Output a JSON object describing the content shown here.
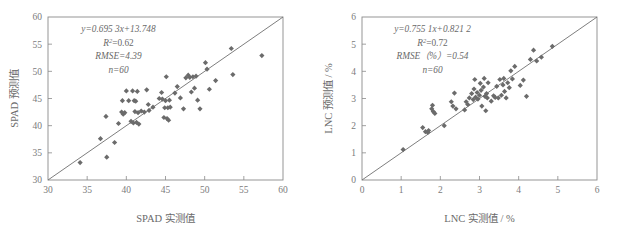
{
  "figure": {
    "panel_count": 2,
    "background": "#ffffff",
    "marker_color": "#6b6b6b",
    "line_color": "#6f6f6f",
    "axis_color": "#8a8a8a",
    "text_color": "#6a6a6a"
  },
  "chart_data": [
    {
      "type": "scatter",
      "panel": "left",
      "title": "",
      "xlabel": "SPAD 实测值",
      "ylabel": "SPAD 预测值",
      "xlim": [
        30,
        60
      ],
      "ylim": [
        30,
        60
      ],
      "xticks": [
        30,
        35,
        40,
        45,
        50,
        55,
        60
      ],
      "yticks": [
        30,
        35,
        40,
        45,
        50,
        55,
        60
      ],
      "grid": false,
      "legend": "none",
      "annotations": {
        "equation": "y=0.695 3x+13.748",
        "r2_label": "R",
        "r2_sup": "2",
        "r2_value": "=0.62",
        "rmse": "RMSE=4.39",
        "n": "n=60"
      },
      "reference_line": {
        "type": "1:1",
        "from": [
          30,
          30
        ],
        "to": [
          60,
          60
        ]
      },
      "points": [
        [
          34.1,
          33.2
        ],
        [
          36.7,
          37.6
        ],
        [
          37.4,
          41.7
        ],
        [
          37.5,
          34.2
        ],
        [
          38.5,
          36.9
        ],
        [
          39.0,
          40.4
        ],
        [
          39.4,
          42.5
        ],
        [
          39.5,
          44.6
        ],
        [
          39.6,
          42.1
        ],
        [
          39.8,
          42.4
        ],
        [
          40.0,
          46.4
        ],
        [
          40.3,
          44.6
        ],
        [
          40.6,
          40.8
        ],
        [
          40.8,
          46.4
        ],
        [
          40.9,
          40.5
        ],
        [
          41.0,
          44.6
        ],
        [
          41.1,
          42.6
        ],
        [
          41.2,
          44.5
        ],
        [
          41.3,
          40.6
        ],
        [
          41.4,
          46.3
        ],
        [
          41.5,
          42.4
        ],
        [
          41.6,
          40.3
        ],
        [
          41.9,
          42.7
        ],
        [
          42.3,
          42.5
        ],
        [
          42.6,
          46.6
        ],
        [
          42.8,
          43.9
        ],
        [
          42.9,
          42.8
        ],
        [
          43.4,
          43.4
        ],
        [
          44.2,
          45.0
        ],
        [
          44.5,
          46.1
        ],
        [
          44.6,
          44.9
        ],
        [
          44.8,
          41.5
        ],
        [
          44.9,
          43.3
        ],
        [
          45.0,
          44.6
        ],
        [
          45.1,
          49.0
        ],
        [
          45.2,
          41.3
        ],
        [
          45.3,
          43.3
        ],
        [
          45.4,
          41.0
        ],
        [
          45.5,
          44.7
        ],
        [
          45.6,
          43.4
        ],
        [
          46.2,
          46.0
        ],
        [
          46.5,
          47.2
        ],
        [
          46.9,
          45.1
        ],
        [
          47.3,
          43.1
        ],
        [
          47.6,
          48.8
        ],
        [
          47.9,
          49.3
        ],
        [
          48.1,
          48.9
        ],
        [
          48.3,
          46.2
        ],
        [
          48.5,
          49.0
        ],
        [
          48.7,
          46.9
        ],
        [
          48.9,
          49.1
        ],
        [
          49.1,
          44.7
        ],
        [
          49.4,
          43.1
        ],
        [
          50.1,
          51.6
        ],
        [
          50.3,
          50.4
        ],
        [
          50.6,
          46.7
        ],
        [
          51.4,
          48.3
        ],
        [
          53.4,
          54.2
        ],
        [
          53.6,
          49.4
        ],
        [
          57.3,
          52.9
        ]
      ]
    },
    {
      "type": "scatter",
      "panel": "right",
      "title": "",
      "xlabel": "LNC 实测值 / %",
      "ylabel": "LNC 预测值 / %",
      "xlim": [
        0,
        6
      ],
      "ylim": [
        0,
        6
      ],
      "xticks": [
        0,
        1,
        2,
        3,
        4,
        5,
        6
      ],
      "yticks": [
        0,
        1,
        2,
        3,
        4,
        5,
        6
      ],
      "grid": false,
      "legend": "none",
      "annotations": {
        "equation": "y=0.755 1x+0.821 2",
        "r2_label": "R",
        "r2_sup": "2",
        "r2_value": "=0.72",
        "rmse": "RMSE（%）=0.54",
        "n": "n=60"
      },
      "reference_line": {
        "type": "1:1",
        "from": [
          0,
          0
        ],
        "to": [
          6,
          6
        ]
      },
      "points": [
        [
          1.05,
          1.12
        ],
        [
          1.55,
          1.93
        ],
        [
          1.62,
          1.78
        ],
        [
          1.68,
          1.75
        ],
        [
          1.7,
          1.82
        ],
        [
          1.78,
          2.62
        ],
        [
          1.8,
          2.75
        ],
        [
          1.82,
          2.52
        ],
        [
          1.86,
          2.45
        ],
        [
          2.1,
          2.0
        ],
        [
          2.28,
          2.88
        ],
        [
          2.32,
          2.72
        ],
        [
          2.36,
          3.2
        ],
        [
          2.4,
          2.62
        ],
        [
          2.62,
          2.58
        ],
        [
          2.66,
          2.88
        ],
        [
          2.7,
          2.78
        ],
        [
          2.74,
          3.02
        ],
        [
          2.8,
          3.18
        ],
        [
          2.84,
          2.96
        ],
        [
          2.86,
          3.35
        ],
        [
          2.88,
          3.7
        ],
        [
          2.9,
          3.05
        ],
        [
          2.94,
          3.22
        ],
        [
          2.96,
          2.98
        ],
        [
          3.0,
          3.12
        ],
        [
          3.02,
          3.56
        ],
        [
          3.04,
          3.3
        ],
        [
          3.06,
          2.72
        ],
        [
          3.1,
          3.42
        ],
        [
          3.12,
          3.74
        ],
        [
          3.14,
          3.08
        ],
        [
          3.16,
          2.55
        ],
        [
          3.18,
          3.18
        ],
        [
          3.2,
          3.02
        ],
        [
          3.22,
          3.58
        ],
        [
          3.3,
          2.9
        ],
        [
          3.36,
          3.1
        ],
        [
          3.4,
          3.04
        ],
        [
          3.44,
          3.45
        ],
        [
          3.48,
          3.02
        ],
        [
          3.52,
          3.7
        ],
        [
          3.56,
          3.12
        ],
        [
          3.6,
          3.5
        ],
        [
          3.62,
          3.74
        ],
        [
          3.64,
          3.26
        ],
        [
          3.68,
          3.02
        ],
        [
          3.72,
          3.58
        ],
        [
          3.76,
          3.4
        ],
        [
          3.8,
          4.02
        ],
        [
          3.84,
          3.72
        ],
        [
          3.9,
          4.18
        ],
        [
          4.04,
          3.48
        ],
        [
          4.12,
          3.68
        ],
        [
          4.2,
          3.08
        ],
        [
          4.3,
          4.44
        ],
        [
          4.38,
          4.78
        ],
        [
          4.46,
          4.38
        ],
        [
          4.58,
          4.52
        ],
        [
          4.86,
          4.92
        ]
      ]
    }
  ]
}
